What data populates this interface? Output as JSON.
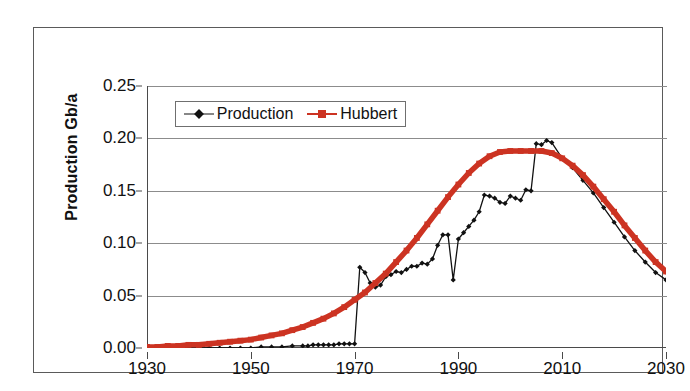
{
  "chart_data": {
    "type": "line",
    "title": "",
    "xlabel": "",
    "ylabel": "Production Gb/a",
    "xlim": [
      1930,
      2030
    ],
    "ylim": [
      0.0,
      0.25
    ],
    "grid": true,
    "legend_position": "top-left-inside",
    "ytick_labels": [
      "0.25",
      "0.20",
      "0.15",
      "0.10",
      "0.05",
      "0.00"
    ],
    "ytick_values": [
      0.25,
      0.2,
      0.15,
      0.1,
      0.05,
      0.0
    ],
    "xtick_labels": [
      "1930",
      "1950",
      "1970",
      "1990",
      "2010",
      "2030"
    ],
    "xtick_values": [
      1930,
      1950,
      1970,
      1990,
      2010,
      2030
    ],
    "series": [
      {
        "name": "Production",
        "color": "#111111",
        "marker": "diamond",
        "x": [
          1930,
          1932,
          1934,
          1936,
          1938,
          1940,
          1942,
          1944,
          1946,
          1948,
          1950,
          1952,
          1954,
          1956,
          1958,
          1960,
          1961,
          1962,
          1963,
          1964,
          1965,
          1966,
          1967,
          1968,
          1969,
          1970,
          1971,
          1972,
          1973,
          1974,
          1975,
          1976,
          1977,
          1978,
          1979,
          1980,
          1981,
          1982,
          1983,
          1984,
          1985,
          1986,
          1987,
          1988,
          1989,
          1990,
          1991,
          1992,
          1993,
          1994,
          1995,
          1996,
          1997,
          1998,
          1999,
          2000,
          2001,
          2002,
          2003,
          2004,
          2005,
          2006,
          2007,
          2008,
          2010,
          2012,
          2014,
          2016,
          2018,
          2020,
          2022,
          2024,
          2026,
          2028,
          2030
        ],
        "values": [
          0.0,
          0.0,
          0.0,
          0.0,
          0.0,
          0.0,
          0.0,
          0.0,
          0.0,
          0.0,
          0.0,
          0.001,
          0.001,
          0.001,
          0.002,
          0.002,
          0.002,
          0.003,
          0.003,
          0.003,
          0.003,
          0.003,
          0.004,
          0.004,
          0.004,
          0.004,
          0.077,
          0.072,
          0.062,
          0.058,
          0.06,
          0.068,
          0.07,
          0.073,
          0.072,
          0.075,
          0.078,
          0.078,
          0.081,
          0.08,
          0.085,
          0.098,
          0.108,
          0.108,
          0.065,
          0.104,
          0.11,
          0.116,
          0.122,
          0.13,
          0.146,
          0.145,
          0.143,
          0.139,
          0.138,
          0.145,
          0.143,
          0.141,
          0.151,
          0.15,
          0.195,
          0.194,
          0.198,
          0.196,
          0.181,
          0.172,
          0.16,
          0.148,
          0.134,
          0.12,
          0.106,
          0.093,
          0.082,
          0.072,
          0.065
        ]
      },
      {
        "name": "Hubbert",
        "color": "#CC3322",
        "marker": "square",
        "x": [
          1930,
          1932,
          1934,
          1936,
          1938,
          1940,
          1942,
          1944,
          1946,
          1948,
          1950,
          1952,
          1954,
          1956,
          1958,
          1960,
          1962,
          1964,
          1966,
          1968,
          1970,
          1972,
          1974,
          1976,
          1978,
          1980,
          1982,
          1984,
          1986,
          1988,
          1990,
          1992,
          1994,
          1996,
          1998,
          2000,
          2002,
          2004,
          2006,
          2008,
          2010,
          2012,
          2014,
          2016,
          2018,
          2020,
          2022,
          2024,
          2026,
          2028,
          2030
        ],
        "values": [
          0.001,
          0.001,
          0.002,
          0.002,
          0.003,
          0.003,
          0.004,
          0.005,
          0.006,
          0.007,
          0.008,
          0.01,
          0.012,
          0.014,
          0.017,
          0.02,
          0.024,
          0.028,
          0.033,
          0.039,
          0.046,
          0.053,
          0.062,
          0.071,
          0.082,
          0.093,
          0.105,
          0.118,
          0.131,
          0.144,
          0.156,
          0.167,
          0.176,
          0.183,
          0.187,
          0.188,
          0.188,
          0.188,
          0.188,
          0.186,
          0.181,
          0.174,
          0.165,
          0.154,
          0.142,
          0.13,
          0.117,
          0.105,
          0.093,
          0.082,
          0.073
        ]
      }
    ]
  },
  "legend": {
    "items": [
      {
        "label": "Production"
      },
      {
        "label": "Hubbert"
      }
    ]
  },
  "colors": {
    "production": "#111111",
    "hubbert": "#CC3322",
    "grid": "#8C8C8C",
    "axis": "#4A4A4A",
    "frame": "#5A5A5A"
  }
}
